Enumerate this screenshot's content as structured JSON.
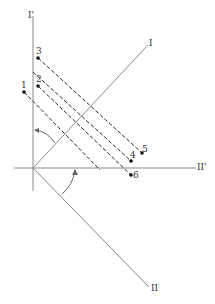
{
  "diagram": {
    "type": "axis-rotation-projection",
    "colors": {
      "axis": "#8a8a8a",
      "dashed": "#2a2a2a",
      "point": "#111111",
      "text": "#333333"
    },
    "axes": {
      "vertical_prime": {
        "label": "I'"
      },
      "horizontal_prime": {
        "label": "II'"
      },
      "rotated_1": {
        "label": "I"
      },
      "rotated_2": {
        "label": "II"
      }
    },
    "points": [
      {
        "label": "1"
      },
      {
        "label": "2"
      },
      {
        "label": "3"
      },
      {
        "label": "4"
      },
      {
        "label": "5"
      },
      {
        "label": "6"
      }
    ],
    "annotations": [
      "rotation arc between I' and I",
      "rotation arc between II' and II"
    ]
  }
}
